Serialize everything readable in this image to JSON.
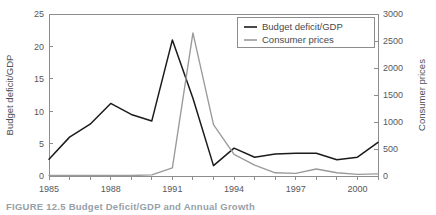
{
  "figure": {
    "caption": "FIGURE 12.5  Budget Deficit/GDP and Annual Growth"
  },
  "legend": {
    "position": "top-right",
    "entries": [
      {
        "label": "Budget deficit/GDP",
        "color": "#1b1b1b"
      },
      {
        "label": "Consumer prices",
        "color": "#9a9a9a"
      }
    ]
  },
  "axes": {
    "left": {
      "title": "Budget deficit/GDP",
      "ticks": [
        "0",
        "5",
        "10",
        "15",
        "20",
        "25"
      ]
    },
    "right": {
      "title": "Consumer prices",
      "ticks": [
        "0",
        "500",
        "1000",
        "1500",
        "2000",
        "2500",
        "3000"
      ]
    },
    "bottom": {
      "title": "",
      "ticks": [
        "1985",
        "1988",
        "1991",
        "1994",
        "1997",
        "2000"
      ]
    }
  },
  "chart_data": {
    "type": "line",
    "title": "Budget Deficit/GDP and Annual Growth",
    "xlabel": "",
    "ylabel": "Budget deficit/GDP",
    "y2label": "Consumer prices",
    "xlim": [
      1985,
      2001
    ],
    "ylim": [
      0,
      25
    ],
    "y2lim": [
      0,
      3000
    ],
    "ytick_values": [
      0,
      5,
      10,
      15,
      20,
      25
    ],
    "y2tick_values": [
      0,
      500,
      1000,
      1500,
      2000,
      2500,
      3000
    ],
    "xtick_values": [
      1985,
      1988,
      1991,
      1994,
      1997,
      2000
    ],
    "xtick_labels": [
      "1985",
      "1988",
      "1991",
      "1994",
      "1997",
      "2000"
    ],
    "grid": false,
    "legend_position": "upper right",
    "x": [
      1985,
      1986,
      1987,
      1988,
      1989,
      1990,
      1991,
      1992,
      1993,
      1994,
      1995,
      1996,
      1997,
      1998,
      1999,
      2000,
      2001
    ],
    "series": [
      {
        "name": "Budget deficit/GDP",
        "axis": "left",
        "color": "#1b1b1b",
        "values": [
          2.6,
          6.0,
          8.0,
          11.2,
          9.5,
          8.5,
          21.0,
          12.0,
          1.6,
          4.3,
          2.9,
          3.4,
          3.5,
          3.5,
          2.5,
          2.9,
          5.2
        ]
      },
      {
        "name": "Consumer prices",
        "axis": "right",
        "color": "#9a9a9a",
        "values": [
          10,
          10,
          10,
          10,
          10,
          20,
          150,
          2650,
          950,
          400,
          200,
          60,
          50,
          130,
          60,
          30,
          40
        ]
      }
    ]
  },
  "colors": {
    "background": "#ffffff",
    "axis": "#8d8d8d",
    "text": "#55585c",
    "series_primary": "#1b1b1b",
    "series_secondary": "#9a9a9a"
  }
}
